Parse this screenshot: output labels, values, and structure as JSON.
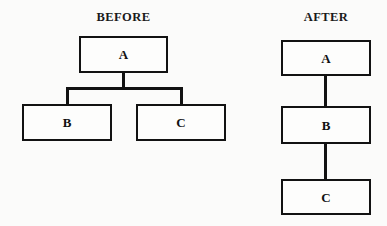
{
  "diagram": {
    "panels": [
      {
        "id": "before",
        "title": "BEFORE",
        "nodes": [
          {
            "id": "before-a",
            "label": "A"
          },
          {
            "id": "before-b",
            "label": "B"
          },
          {
            "id": "before-c",
            "label": "C"
          }
        ],
        "edges": [
          {
            "from": "A",
            "to": "B"
          },
          {
            "from": "A",
            "to": "C"
          }
        ],
        "structure": "A branches to B and C"
      },
      {
        "id": "after",
        "title": "AFTER",
        "nodes": [
          {
            "id": "after-a",
            "label": "A"
          },
          {
            "id": "after-b",
            "label": "B"
          },
          {
            "id": "after-c",
            "label": "C"
          }
        ],
        "edges": [
          {
            "from": "A",
            "to": "B"
          },
          {
            "from": "B",
            "to": "C"
          }
        ],
        "structure": "A to B to C in a chain"
      }
    ],
    "colors": {
      "stroke": "#121212",
      "box_fill": "#fdfdfc",
      "text": "#111111",
      "background": "#fbfbfa"
    }
  }
}
